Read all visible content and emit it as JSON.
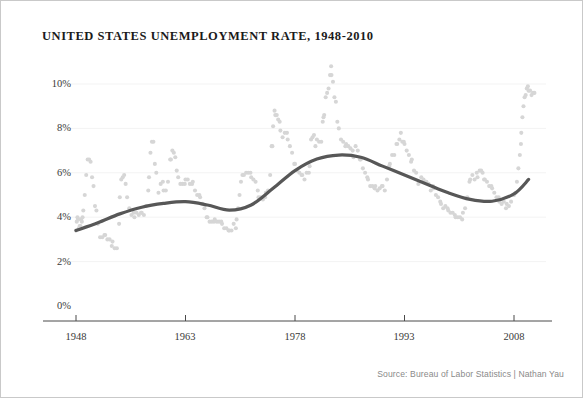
{
  "figure": {
    "title": "UNITED STATES UNEMPLOYMENT RATE, 1948-2010",
    "source_note": "Source: Bureau of Labor Statistics | Nathan Yau",
    "border_color": "#c9c9c9",
    "background": "#ffffff"
  },
  "chart_data": {
    "type": "scatter",
    "title": "UNITED STATES UNEMPLOYMENT RATE, 1948-2010",
    "subtitle": "",
    "xlabel": "",
    "ylabel": "",
    "xlim": [
      1947.0,
      2011.0
    ],
    "ylim": [
      0,
      11.0
    ],
    "grid": true,
    "grid_axis": "y",
    "legend": "none",
    "annotations": [],
    "colors": {
      "points": "#d6d6d6",
      "trend_line": "#575757",
      "axis": "#4a4a4a",
      "gridline": "#f3f3f3",
      "tick_label": "#3a3a3a"
    },
    "x_ticks": [
      1948,
      1963,
      1978,
      1993,
      2008
    ],
    "x_tick_labels": [
      "1948",
      "1963",
      "1978",
      "1993",
      "2008"
    ],
    "y_ticks": [
      0,
      2,
      4,
      6,
      8,
      10
    ],
    "y_tick_labels": [
      "0%",
      "2%",
      "4%",
      "6%",
      "8%",
      "10%"
    ],
    "series": [
      {
        "name": "Monthly unemployment rate",
        "type": "scatter",
        "marker": "circle",
        "color": "#d6d6d6",
        "x": [
          1948.0,
          1948.1,
          1948.2,
          1948.3,
          1948.4,
          1948.5,
          1948.6,
          1948.7,
          1948.8,
          1948.9,
          1949.0,
          1949.2,
          1949.4,
          1949.6,
          1949.8,
          1950.0,
          1950.2,
          1950.4,
          1950.6,
          1950.8,
          1951.0,
          1951.3,
          1951.6,
          1951.9,
          1952.0,
          1952.3,
          1952.6,
          1952.9,
          1953.0,
          1953.3,
          1953.6,
          1953.9,
          1954.0,
          1954.2,
          1954.4,
          1954.6,
          1954.8,
          1955.0,
          1955.3,
          1955.6,
          1955.9,
          1956.0,
          1956.3,
          1956.6,
          1956.9,
          1957.0,
          1957.3,
          1957.6,
          1957.9,
          1958.0,
          1958.2,
          1958.4,
          1958.6,
          1958.8,
          1959.0,
          1959.3,
          1959.6,
          1959.9,
          1960.0,
          1960.3,
          1960.6,
          1960.9,
          1961.0,
          1961.2,
          1961.4,
          1961.6,
          1961.8,
          1962.0,
          1962.3,
          1962.6,
          1962.9,
          1963.0,
          1963.3,
          1963.6,
          1963.9,
          1964.0,
          1964.3,
          1964.6,
          1964.9,
          1965.0,
          1965.3,
          1965.6,
          1965.9,
          1966.0,
          1966.3,
          1966.6,
          1966.9,
          1967.0,
          1967.3,
          1967.6,
          1967.9,
          1968.0,
          1968.3,
          1968.6,
          1968.9,
          1969.0,
          1969.3,
          1969.6,
          1969.9,
          1970.0,
          1970.2,
          1970.4,
          1970.6,
          1970.8,
          1971.0,
          1971.3,
          1971.6,
          1971.9,
          1972.0,
          1972.3,
          1972.6,
          1972.9,
          1973.0,
          1973.3,
          1973.6,
          1973.9,
          1974.0,
          1974.3,
          1974.6,
          1974.8,
          1974.9,
          1975.0,
          1975.2,
          1975.3,
          1975.5,
          1975.7,
          1975.9,
          1976.0,
          1976.3,
          1976.6,
          1976.9,
          1977.0,
          1977.3,
          1977.6,
          1977.9,
          1978.0,
          1978.3,
          1978.6,
          1978.9,
          1979.0,
          1979.3,
          1979.6,
          1979.9,
          1980.0,
          1980.2,
          1980.4,
          1980.6,
          1980.8,
          1981.0,
          1981.3,
          1981.6,
          1981.8,
          1981.9,
          1982.0,
          1982.2,
          1982.4,
          1982.6,
          1982.8,
          1982.95,
          1983.0,
          1983.2,
          1983.4,
          1983.6,
          1983.8,
          1984.0,
          1984.3,
          1984.6,
          1984.9,
          1985.0,
          1985.3,
          1985.6,
          1985.9,
          1986.0,
          1986.3,
          1986.6,
          1986.9,
          1987.0,
          1987.3,
          1987.6,
          1987.9,
          1988.0,
          1988.3,
          1988.6,
          1988.9,
          1989.0,
          1989.3,
          1989.6,
          1989.9,
          1990.0,
          1990.3,
          1990.6,
          1990.9,
          1991.0,
          1991.3,
          1991.6,
          1991.9,
          1992.0,
          1992.3,
          1992.5,
          1992.7,
          1992.9,
          1993.0,
          1993.3,
          1993.6,
          1993.9,
          1994.0,
          1994.3,
          1994.6,
          1994.9,
          1995.0,
          1995.3,
          1995.6,
          1995.9,
          1996.0,
          1996.3,
          1996.6,
          1996.9,
          1997.0,
          1997.3,
          1997.6,
          1997.9,
          1998.0,
          1998.3,
          1998.6,
          1998.9,
          1999.0,
          1999.3,
          1999.6,
          1999.9,
          2000.0,
          2000.3,
          2000.6,
          2000.9,
          2001.0,
          2001.3,
          2001.6,
          2001.9,
          2002.0,
          2002.3,
          2002.6,
          2002.9,
          2003.0,
          2003.3,
          2003.5,
          2003.7,
          2003.9,
          2004.0,
          2004.3,
          2004.6,
          2004.9,
          2005.0,
          2005.3,
          2005.6,
          2005.9,
          2006.0,
          2006.3,
          2006.6,
          2006.9,
          2007.0,
          2007.3,
          2007.6,
          2007.9,
          2008.0,
          2008.2,
          2008.4,
          2008.6,
          2008.8,
          2008.95,
          2009.0,
          2009.15,
          2009.3,
          2009.45,
          2009.6,
          2009.75,
          2009.9,
          2010.0,
          2010.2,
          2010.4,
          2010.6,
          2010.8
        ],
        "y": [
          3.4,
          3.8,
          4.0,
          3.9,
          3.5,
          3.6,
          3.6,
          3.9,
          3.8,
          4.0,
          4.3,
          5.0,
          5.9,
          6.6,
          6.6,
          6.5,
          5.8,
          5.4,
          4.5,
          4.3,
          3.7,
          3.1,
          3.1,
          3.2,
          3.2,
          3.0,
          3.0,
          2.7,
          2.9,
          2.6,
          2.6,
          3.7,
          4.9,
          5.7,
          5.8,
          5.9,
          5.5,
          4.9,
          4.4,
          4.1,
          4.2,
          4.0,
          4.2,
          4.1,
          4.2,
          4.2,
          4.1,
          4.5,
          5.2,
          5.8,
          6.9,
          7.4,
          7.4,
          6.4,
          6.0,
          5.1,
          5.5,
          5.6,
          5.2,
          5.2,
          5.6,
          6.6,
          6.6,
          7.0,
          6.9,
          6.7,
          6.1,
          5.8,
          5.5,
          5.5,
          5.5,
          5.7,
          5.7,
          5.5,
          5.5,
          5.6,
          5.2,
          5.0,
          5.0,
          4.9,
          4.6,
          4.4,
          4.0,
          4.0,
          3.8,
          3.8,
          3.8,
          3.9,
          3.8,
          3.8,
          3.8,
          3.7,
          3.5,
          3.5,
          3.4,
          3.4,
          3.4,
          3.7,
          3.5,
          3.9,
          4.4,
          5.0,
          5.6,
          5.9,
          5.9,
          6.0,
          6.0,
          6.0,
          5.8,
          5.7,
          5.6,
          5.2,
          4.9,
          4.9,
          4.8,
          4.9,
          5.1,
          5.2,
          5.9,
          7.2,
          7.2,
          8.1,
          8.8,
          8.6,
          8.6,
          8.4,
          8.3,
          7.9,
          7.6,
          7.8,
          7.8,
          7.5,
          7.2,
          6.9,
          6.4,
          6.4,
          6.1,
          6.0,
          5.9,
          5.9,
          5.7,
          6.0,
          6.0,
          6.3,
          7.5,
          7.6,
          7.7,
          7.2,
          7.5,
          7.4,
          7.4,
          8.3,
          8.5,
          8.6,
          9.4,
          9.6,
          9.8,
          10.4,
          10.8,
          10.4,
          10.1,
          9.4,
          9.2,
          8.3,
          8.0,
          7.5,
          7.4,
          7.2,
          7.3,
          7.2,
          7.1,
          7.0,
          6.7,
          7.2,
          7.0,
          6.6,
          6.6,
          6.2,
          6.0,
          5.8,
          5.7,
          5.4,
          5.4,
          5.3,
          5.4,
          5.2,
          5.3,
          5.4,
          5.4,
          5.2,
          5.7,
          6.3,
          6.4,
          6.8,
          6.8,
          7.3,
          7.3,
          7.5,
          7.8,
          7.4,
          7.4,
          7.3,
          7.0,
          6.8,
          6.5,
          6.6,
          6.1,
          6.0,
          5.5,
          5.6,
          5.8,
          5.7,
          5.6,
          5.6,
          5.5,
          5.2,
          5.4,
          5.3,
          5.0,
          4.9,
          4.7,
          4.6,
          4.4,
          4.5,
          4.4,
          4.3,
          4.2,
          4.2,
          4.1,
          4.0,
          4.0,
          4.0,
          3.9,
          4.2,
          4.4,
          4.9,
          5.6,
          5.7,
          5.9,
          5.7,
          6.0,
          5.8,
          6.1,
          6.1,
          6.0,
          5.7,
          5.7,
          5.6,
          5.4,
          5.4,
          5.3,
          5.1,
          4.9,
          4.9,
          4.7,
          4.6,
          4.7,
          4.4,
          4.6,
          4.5,
          4.7,
          5.0,
          5.0,
          5.1,
          5.6,
          6.2,
          6.8,
          7.3,
          7.8,
          8.5,
          9.0,
          9.4,
          9.5,
          9.8,
          9.9,
          9.7,
          9.7,
          9.5,
          9.6,
          9.6
        ]
      },
      {
        "name": "Smoothed trend",
        "type": "line",
        "color": "#575757",
        "line_width": 3.2,
        "x": [
          1948,
          1951,
          1954,
          1957,
          1960,
          1963,
          1966,
          1969,
          1972,
          1975,
          1978,
          1981,
          1984,
          1987,
          1990,
          1993,
          1996,
          1999,
          2002,
          2005,
          2008,
          2010
        ],
        "y": [
          3.4,
          3.75,
          4.15,
          4.45,
          4.62,
          4.7,
          4.55,
          4.32,
          4.55,
          5.3,
          6.1,
          6.62,
          6.8,
          6.7,
          6.3,
          5.9,
          5.5,
          5.1,
          4.8,
          4.72,
          5.05,
          5.7
        ]
      }
    ]
  },
  "axes": {
    "y_labels": [
      "10%",
      "8%",
      "6%",
      "4%",
      "2%",
      "0%"
    ],
    "x_labels": [
      "1948",
      "1963",
      "1978",
      "1993",
      "2008"
    ]
  }
}
